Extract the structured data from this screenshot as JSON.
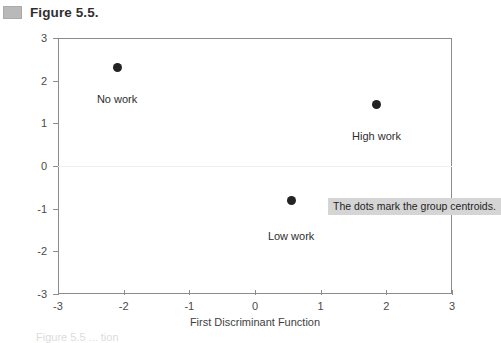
{
  "figure": {
    "title": "Figure 5.5.",
    "swatch_color": "#b9b9b9"
  },
  "annotation": {
    "text": "The dots mark the group centroids.",
    "background": "#d5d5d5"
  },
  "page_bleed": {
    "text": "Figure 5.5 ... tion"
  },
  "chart_data": {
    "type": "scatter",
    "title": "Figure 5.5.",
    "xlabel": "First Discriminant Function",
    "ylabel": "Second Discriminant Function",
    "xlim": [
      -3,
      3
    ],
    "ylim": [
      -3,
      3
    ],
    "xticks": [
      -3,
      -2,
      -1,
      0,
      1,
      2,
      3
    ],
    "yticks": [
      -3,
      -2,
      -1,
      0,
      1,
      2,
      3
    ],
    "xticklabels": [
      "-3",
      "-2",
      "-1",
      "0",
      "1",
      "2",
      "3"
    ],
    "yticklabels": [
      "-3",
      "-2",
      "-1",
      "0",
      "1",
      "2",
      "3"
    ],
    "grid": false,
    "legend": "none",
    "marker_color": "#232323",
    "points": [
      {
        "label": "No work",
        "x": -2.1,
        "y": 2.3,
        "label_dx": 0.0,
        "label_dy": -0.72
      },
      {
        "label": "High work",
        "x": 1.85,
        "y": 1.45,
        "label_dx": 0.0,
        "label_dy": -0.75
      },
      {
        "label": "Low work",
        "x": 0.55,
        "y": -0.8,
        "label_dx": 0.0,
        "label_dy": -0.85
      }
    ],
    "annotations": [
      {
        "text": "The dots mark the group centroids."
      }
    ]
  }
}
